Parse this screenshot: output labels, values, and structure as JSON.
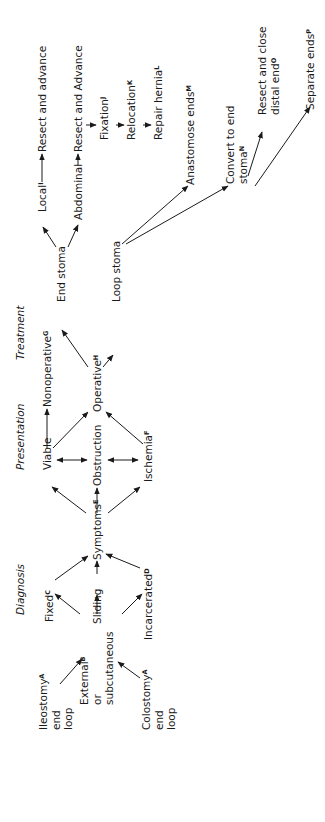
{
  "headers": {
    "diagnosis": "Diagnosis",
    "presentation": "Presentation",
    "treatment": "Treatment"
  },
  "nodes": {
    "ileostomy": {
      "line1": "Ileostomy",
      "sup": "A",
      "line2": "end",
      "line3": "loop"
    },
    "colostomy": {
      "line1": "Colostomy",
      "sup": "A",
      "line2": "end",
      "line3": "loop"
    },
    "external": {
      "line1": "External",
      "sup": "B",
      "line2": "or",
      "line3": "subcutaneous"
    },
    "fixed": {
      "label": "Fixed",
      "sup": "C"
    },
    "sliding": {
      "label": "Sliding"
    },
    "incarcerated": {
      "label": "Incarcerated",
      "sup": "D"
    },
    "symptoms": {
      "label": "Symptoms",
      "sup": "E"
    },
    "viable": {
      "label": "Viable"
    },
    "obstruction": {
      "label": "Obstruction"
    },
    "ischemia": {
      "label": "Ischemia",
      "sup": "F"
    },
    "nonoperative": {
      "label": "Nonoperative",
      "sup": "G"
    },
    "operative": {
      "label": "Operative",
      "sup": "H"
    },
    "end_stoma": {
      "label": "End stoma"
    },
    "loop_stoma": {
      "label": "Loop stoma"
    },
    "local": {
      "label": "Local",
      "sup": "I"
    },
    "resect_advance_local": {
      "label": "Resect and advance"
    },
    "abdominal": {
      "label": "Abdominal"
    },
    "resect_advance_abd": {
      "label": "Resect and Advance"
    },
    "fixation": {
      "label": "Fixation",
      "sup": "J"
    },
    "relocation": {
      "label": "Relocation",
      "sup": "K"
    },
    "repair_hernia": {
      "label": "Repair hernia",
      "sup": "L"
    },
    "anastomose": {
      "label": "Anastomose ends",
      "sup": "M"
    },
    "convert": {
      "line1": "Convert to end",
      "line2": "stoma",
      "sup": "N"
    },
    "resect_close": {
      "line1": "Resect and close",
      "line2": "distal end",
      "sup": "O"
    },
    "separate": {
      "label": "Separate ends",
      "sup": "P"
    }
  },
  "colors": {
    "ink": "#1a1a1a",
    "background": "#ffffff"
  }
}
